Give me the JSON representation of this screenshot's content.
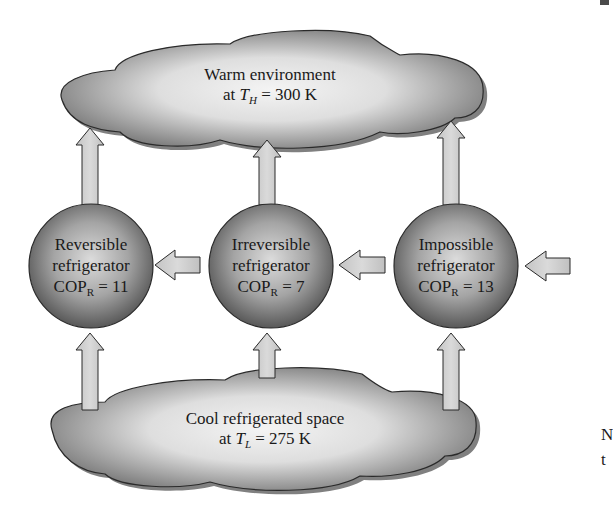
{
  "figure": {
    "warm_environment": {
      "line1": "Warm environment",
      "line2_prefix": "at ",
      "symbol": "T",
      "subscript": "H",
      "line2_suffix": " = 300 K"
    },
    "cool_space": {
      "line1": "Cool refrigerated space",
      "line2_prefix": "at ",
      "symbol": "T",
      "subscript": "L",
      "line2_suffix": " = 275 K"
    },
    "refrigerators": [
      {
        "line1": "Reversible",
        "line2": "refrigerator",
        "cop_label": "COP",
        "cop_sub": "R",
        "cop_value": " = 11"
      },
      {
        "line1": "Irreversible",
        "line2": "refrigerator",
        "cop_label": "COP",
        "cop_sub": "R",
        "cop_value": " = 7"
      },
      {
        "line1": "Impossible",
        "line2": "refrigerator",
        "cop_label": "COP",
        "cop_sub": "R",
        "cop_value": " = 13"
      }
    ],
    "edge_text": {
      "line1": "N",
      "line2": "t"
    },
    "colors": {
      "cloud_dark": "#6e6e6e",
      "cloud_light": "#f2f2f2",
      "circle_dark": "#5a5a5a",
      "circle_light": "#d8d8d8",
      "arrow_fill": "#d0d0d0",
      "outline": "#2a2a2a"
    }
  }
}
